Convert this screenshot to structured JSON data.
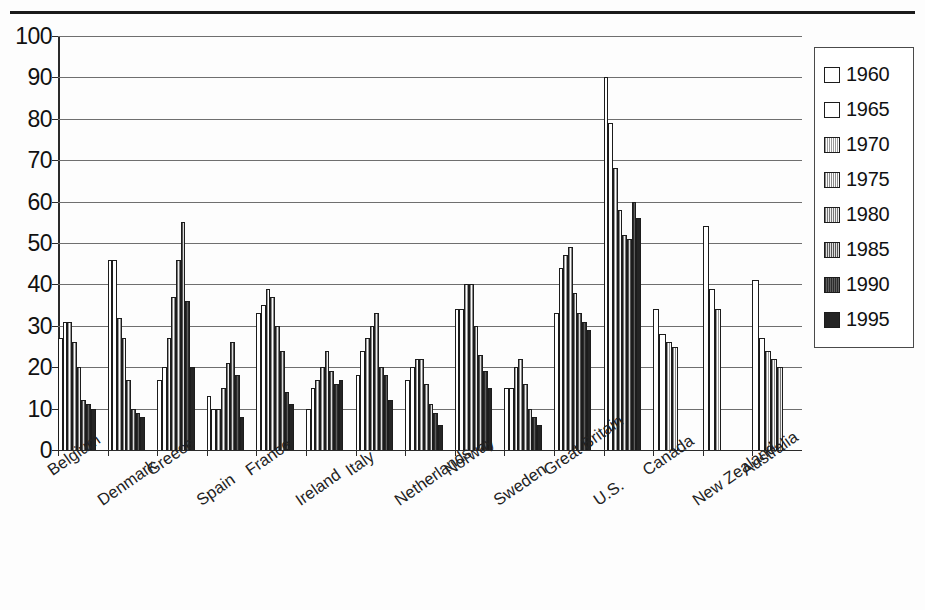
{
  "legend": {
    "position": "right",
    "entries": [
      {
        "label": "1960",
        "swatch": "white-open-square"
      },
      {
        "label": "1965",
        "swatch": "white-open-square"
      },
      {
        "label": "1970",
        "swatch": "light-hatched-square"
      },
      {
        "label": "1975",
        "swatch": "light-hatched-square"
      },
      {
        "label": "1980",
        "swatch": "medium-hatched-square"
      },
      {
        "label": "1985",
        "swatch": "medium-dark-hatched-square"
      },
      {
        "label": "1990",
        "swatch": "dark-hatched-square"
      },
      {
        "label": "1995",
        "swatch": "solid-black-square"
      }
    ]
  },
  "yaxis": {
    "ticks": [
      "100",
      "90",
      "80",
      "70",
      "60",
      "50",
      "40",
      "30",
      "20",
      "10",
      "0"
    ]
  },
  "chart_data": {
    "type": "bar",
    "title": "",
    "subtitle": "",
    "xlabel": "",
    "ylabel": "",
    "ylim": [
      0,
      100
    ],
    "ytick_step": 10,
    "grid": true,
    "legend_position": "right",
    "orientation": "vertical",
    "categories": [
      "Belgium",
      "Denmark",
      "Greece",
      "Spain",
      "France",
      "Ireland",
      "Italy",
      "Netherlands",
      "Norway",
      "Sweden",
      "Great Britain",
      "U.S.",
      "Canada",
      "New Zealand",
      "Australia"
    ],
    "series": [
      {
        "name": "1960",
        "values": [
          27,
          46,
          17,
          13,
          33,
          10,
          18,
          17,
          34,
          15,
          33,
          90,
          34,
          54,
          41
        ]
      },
      {
        "name": "1965",
        "values": [
          31,
          46,
          20,
          10,
          35,
          15,
          24,
          20,
          34,
          15,
          44,
          79,
          28,
          39,
          27
        ]
      },
      {
        "name": "1970",
        "values": [
          31,
          32,
          27,
          10,
          39,
          17,
          27,
          22,
          40,
          20,
          47,
          68,
          26,
          34,
          24
        ]
      },
      {
        "name": "1975",
        "values": [
          26,
          27,
          37,
          15,
          37,
          20,
          30,
          22,
          40,
          22,
          49,
          58,
          25,
          null,
          22
        ]
      },
      {
        "name": "1980",
        "values": [
          20,
          17,
          46,
          21,
          30,
          24,
          33,
          16,
          30,
          16,
          38,
          52,
          null,
          null,
          20
        ]
      },
      {
        "name": "1985",
        "values": [
          12,
          10,
          55,
          26,
          24,
          19,
          20,
          11,
          23,
          10,
          33,
          51,
          null,
          null,
          null
        ]
      },
      {
        "name": "1990",
        "values": [
          11,
          9,
          36,
          18,
          14,
          16,
          18,
          9,
          19,
          8,
          31,
          60,
          null,
          null,
          null
        ]
      },
      {
        "name": "1995",
        "values": [
          10,
          8,
          20,
          8,
          11,
          17,
          12,
          6,
          15,
          6,
          29,
          56,
          null,
          null,
          null
        ]
      }
    ]
  }
}
